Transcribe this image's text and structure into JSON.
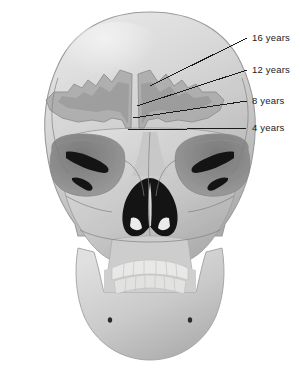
{
  "diagram": {
    "view": "anterior",
    "background_color": "#ffffff"
  },
  "palette": {
    "bone_light": "#d2d2d2",
    "bone_mid": "#c0c0c0",
    "bone_shadow": "#a8a8a8",
    "bone_highlight": "#e4e4e4",
    "teeth": "#e8e8e6",
    "orbit_socket": "#8d8d8d",
    "orbit_deep": "#767676",
    "cavity_black": "#141414",
    "sinus_outer": "#a9a9a9",
    "sinus_inner": "#8f8f8f",
    "suture_line": "#7d7d7d",
    "leader_line": "#1a1a1a",
    "label_text": "#1a1a1a"
  },
  "labels": [
    {
      "id": "label-16-years",
      "text": "16 years",
      "x": 252,
      "y": 33,
      "tick_x1": 235,
      "tick_x2": 247,
      "tick_y": 38,
      "leader_from_x": 235,
      "leader_from_y": 38,
      "leader_to_x": 150,
      "leader_to_y": 86,
      "stage_years": 16
    },
    {
      "id": "label-12-years",
      "text": "12 years",
      "x": 252,
      "y": 65,
      "tick_x1": 235,
      "tick_x2": 247,
      "tick_y": 70,
      "leader_from_x": 235,
      "leader_from_y": 70,
      "leader_to_x": 137,
      "leader_to_y": 106,
      "stage_years": 12
    },
    {
      "id": "label-8-years",
      "text": "8 years",
      "x": 252,
      "y": 96,
      "tick_x1": 235,
      "tick_x2": 247,
      "tick_y": 101,
      "leader_from_x": 235,
      "leader_from_y": 101,
      "leader_to_x": 133,
      "leader_to_y": 118,
      "stage_years": 8
    },
    {
      "id": "label-4-years",
      "text": "4 years",
      "x": 252,
      "y": 123,
      "tick_x1": 235,
      "tick_x2": 247,
      "tick_y": 128,
      "leader_from_x": 235,
      "leader_from_y": 128,
      "leader_to_x": 128,
      "leader_to_y": 130,
      "stage_years": 4
    }
  ],
  "regions": [
    {
      "id": "cranium",
      "name": "cranial-vault"
    },
    {
      "id": "frontal-sinus-left",
      "name": "frontal-sinus-left"
    },
    {
      "id": "frontal-sinus-right",
      "name": "frontal-sinus-right"
    },
    {
      "id": "orbit-left",
      "name": "orbit-left"
    },
    {
      "id": "orbit-right",
      "name": "orbit-right"
    },
    {
      "id": "nasal-aperture",
      "name": "nasal-aperture"
    },
    {
      "id": "maxilla",
      "name": "maxilla"
    },
    {
      "id": "mandible",
      "name": "mandible"
    },
    {
      "id": "teeth-upper",
      "name": "upper-dental-arch"
    },
    {
      "id": "teeth-lower",
      "name": "lower-dental-arch"
    }
  ]
}
